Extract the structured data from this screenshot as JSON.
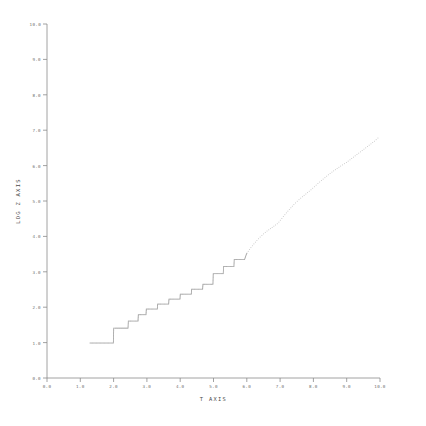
{
  "chart_data": {
    "type": "line",
    "title": "",
    "subtitle": "",
    "xlabel": "T AXIS",
    "ylabel": "LOG Z AXIS",
    "xlim": [
      0.0,
      10.0
    ],
    "ylim": [
      0.0,
      10.0
    ],
    "grid": false,
    "legend": null,
    "legend_position": "none",
    "xticks": [
      "0.0",
      "1.0",
      "2.0",
      "3.0",
      "4.0",
      "5.0",
      "6.0",
      "7.0",
      "8.0",
      "9.0",
      "10.0"
    ],
    "xtick_values": [
      0.0,
      1.0,
      2.0,
      3.0,
      4.0,
      5.0,
      6.0,
      7.0,
      8.0,
      9.0,
      10.0
    ],
    "yticks": [
      "0.0",
      "1.0",
      "2.0",
      "3.0",
      "4.0",
      "5.0",
      "6.0",
      "7.0",
      "8.0",
      "9.0",
      "10.0"
    ],
    "ytick_values": [
      0.0,
      1.0,
      2.0,
      3.0,
      4.0,
      5.0,
      6.0,
      7.0,
      8.0,
      9.0,
      10.0
    ],
    "marker_style": "fine-dotted",
    "line_color": "#8c8c8c",
    "axis_color": "#8a8a8a",
    "background_color": "#ffffff",
    "series": [
      {
        "name": "log z",
        "x": [
          1.28,
          1.4,
          1.52,
          1.64,
          1.76,
          1.88,
          1.98,
          1.99,
          2.02,
          2.1,
          2.18,
          2.26,
          2.34,
          2.42,
          2.43,
          2.52,
          2.62,
          2.72,
          2.73,
          2.84,
          2.96,
          2.97,
          3.08,
          3.2,
          3.3,
          3.31,
          3.42,
          3.54,
          3.64,
          3.65,
          3.76,
          3.88,
          3.98,
          3.99,
          4.1,
          4.22,
          4.32,
          4.33,
          4.44,
          4.56,
          4.66,
          4.67,
          4.78,
          4.88,
          4.97,
          4.98,
          5.08,
          5.18,
          5.28,
          5.29,
          5.4,
          5.5,
          5.6,
          5.61,
          5.72,
          5.82,
          5.92,
          5.98,
          6.08,
          6.2,
          6.32,
          6.44,
          6.56,
          6.68,
          6.8,
          6.92,
          7.04,
          7.16,
          7.28,
          7.4,
          7.52,
          7.64,
          7.76,
          7.88,
          8.0,
          8.14,
          8.28,
          8.42,
          8.56,
          8.7,
          8.84,
          8.98,
          9.12,
          9.26,
          9.4,
          9.54,
          9.68,
          9.82,
          9.96
        ],
        "y": [
          1.0,
          1.0,
          1.0,
          1.0,
          1.0,
          1.0,
          1.0,
          1.42,
          1.42,
          1.42,
          1.42,
          1.42,
          1.42,
          1.42,
          1.62,
          1.62,
          1.62,
          1.62,
          1.8,
          1.8,
          1.8,
          1.96,
          1.96,
          1.96,
          1.96,
          2.1,
          2.1,
          2.1,
          2.1,
          2.24,
          2.24,
          2.24,
          2.24,
          2.38,
          2.38,
          2.38,
          2.38,
          2.52,
          2.52,
          2.52,
          2.52,
          2.66,
          2.66,
          2.66,
          2.66,
          2.96,
          2.96,
          2.96,
          2.96,
          3.16,
          3.16,
          3.16,
          3.16,
          3.36,
          3.36,
          3.36,
          3.36,
          3.52,
          3.66,
          3.8,
          3.93,
          4.04,
          4.14,
          4.22,
          4.3,
          4.38,
          4.52,
          4.66,
          4.79,
          4.91,
          5.02,
          5.12,
          5.21,
          5.3,
          5.4,
          5.52,
          5.63,
          5.74,
          5.84,
          5.93,
          6.02,
          6.1,
          6.2,
          6.3,
          6.4,
          6.5,
          6.6,
          6.7,
          6.82
        ]
      }
    ]
  },
  "figure": {
    "plot_left_px": 47,
    "plot_right_px": 380,
    "plot_top_px": 24,
    "plot_bottom_px": 378
  }
}
